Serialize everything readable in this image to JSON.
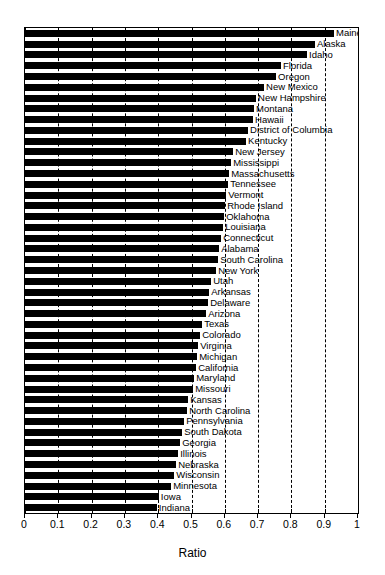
{
  "chart_data": {
    "type": "bar",
    "orientation": "horizontal",
    "title": "",
    "xlabel": "Ratio",
    "ylabel": "",
    "xlim": [
      0,
      1
    ],
    "ylim": null,
    "grid": true,
    "grid_axis": "x",
    "grid_style": "dashed",
    "legend": null,
    "bar_color": "#000000",
    "background": "#ffffff",
    "xticks": [
      "0",
      "0.1",
      "0.2",
      "0.3",
      "0.4",
      "0.5",
      "0.6",
      "0.7",
      "0.8",
      "0.9",
      "1"
    ],
    "xtick_values": [
      0,
      0.1,
      0.2,
      0.3,
      0.4,
      0.5,
      0.6,
      0.7,
      0.8,
      0.9,
      1
    ],
    "label_position": "inline-right-of-bar",
    "categories": [
      "Maine",
      "Alaska",
      "Idaho",
      "Florida",
      "Oregon",
      "New Mexico",
      "New Hampshire",
      "Montana",
      "Hawaii",
      "District of Columbia",
      "Kentucky",
      "New Jersey",
      "Mississippi",
      "Massachusetts",
      "Tennessee",
      "Vermont",
      "Rhode Island",
      "Oklahoma",
      "Louisiana",
      "Connecticut",
      "Alabama",
      "South Carolina",
      "New York",
      "Utah",
      "Arkansas",
      "Delaware",
      "Arizona",
      "Texas",
      "Colorado",
      "Virginia",
      "Michigan",
      "California",
      "Maryland",
      "Missouri",
      "Kansas",
      "North Carolina",
      "Pennsylvania",
      "South Dakota",
      "Georgia",
      "Illinois",
      "Nebraska",
      "Wisconsin",
      "Minnesota",
      "Iowa",
      "Indiana"
    ],
    "values": [
      0.928,
      0.871,
      0.847,
      0.769,
      0.754,
      0.718,
      0.694,
      0.688,
      0.685,
      0.67,
      0.664,
      0.625,
      0.619,
      0.613,
      0.61,
      0.604,
      0.601,
      0.598,
      0.595,
      0.589,
      0.583,
      0.58,
      0.574,
      0.559,
      0.553,
      0.55,
      0.544,
      0.532,
      0.526,
      0.52,
      0.517,
      0.514,
      0.508,
      0.505,
      0.49,
      0.487,
      0.478,
      0.472,
      0.466,
      0.46,
      0.454,
      0.448,
      0.439,
      0.402,
      0.396
    ]
  }
}
